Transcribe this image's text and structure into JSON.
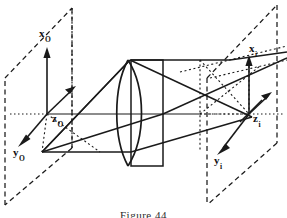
{
  "figure": {
    "caption": "Figure 44",
    "type": "optical-ray-diagram",
    "background_color": "#ffffff",
    "line_color": "#1a1a1a"
  },
  "object_plane": {
    "name": "object plane",
    "style": "dashed parallelogram",
    "origin": {
      "x": 47,
      "y": 114
    },
    "labels": {
      "x_axis": {
        "base": "x",
        "sub": "O",
        "pos_x": 39,
        "pos_y": 28
      },
      "y_axis": {
        "base": "y",
        "sub": "O",
        "pos_x": 13,
        "pos_y": 147
      },
      "z_axis": {
        "base": "z",
        "sub": "O",
        "pos_x": 52,
        "pos_y": 113
      }
    }
  },
  "image_plane": {
    "name": "image plane",
    "style": "dashed parallelogram",
    "origin": {
      "x": 249,
      "y": 114
    },
    "labels": {
      "x_axis": {
        "base": "x",
        "sub": "i",
        "pos_x": 249,
        "pos_y": 43
      },
      "y_axis": {
        "base": "y",
        "sub": "i",
        "pos_x": 214,
        "pos_y": 155
      },
      "z_axis": {
        "base": "z",
        "sub": "i",
        "pos_x": 253,
        "pos_y": 113
      }
    }
  },
  "lens": {
    "name": "biconvex lens",
    "housing": "rectangular frame",
    "center_x": 139,
    "top_y": 58,
    "bottom_y": 166,
    "optical_axis_y": 114
  },
  "rays": {
    "count": 3,
    "description": "rays from object point through lens converging at image point"
  }
}
